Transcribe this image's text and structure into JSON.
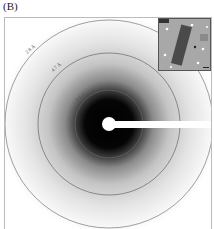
{
  "figure": {
    "panel_label": "(B)",
    "type": "diffraction pattern",
    "rings": [
      {
        "label": "2.8 Å",
        "radius": 104
      },
      {
        "label": "4.7 Å",
        "radius": 71
      },
      {
        "label": "9.4 Å",
        "radius": 34
      }
    ],
    "inset": {
      "description": "micrograph of rectangular crystal",
      "has_scale_bar": true
    },
    "colors": {
      "ring": "#666666",
      "center": "#000000",
      "background": "#ffffff",
      "inset_bg": "#a8a8a8",
      "crystal": "#4a4a4a"
    }
  }
}
